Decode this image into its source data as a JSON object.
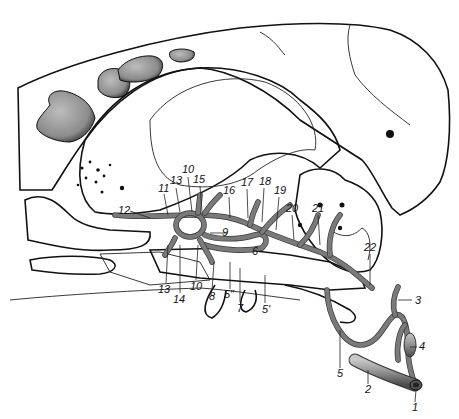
{
  "figure": {
    "type": "anatomical line drawing",
    "colors": {
      "background": "#ffffff",
      "line": "#111111",
      "stipple_bone": "#c9c9c9",
      "vessel": "#7a7a7a",
      "dark_foramen": "#111111"
    }
  },
  "labels": [
    {
      "id": "1",
      "text": "1",
      "x": 412,
      "y": 411
    },
    {
      "id": "2",
      "text": "2",
      "x": 365,
      "y": 393
    },
    {
      "id": "3",
      "text": "3",
      "x": 415,
      "y": 304
    },
    {
      "id": "4",
      "text": "4",
      "x": 419,
      "y": 350
    },
    {
      "id": "5",
      "text": "5",
      "x": 337,
      "y": 377
    },
    {
      "id": "5prime",
      "text": "5'",
      "x": 262,
      "y": 313
    },
    {
      "id": "5doubleprime",
      "text": "5\"",
      "x": 226,
      "y": 298
    },
    {
      "id": "6",
      "text": "6",
      "x": 252,
      "y": 255
    },
    {
      "id": "7",
      "text": "7",
      "x": 238,
      "y": 311
    },
    {
      "id": "8",
      "text": "8",
      "x": 209,
      "y": 300
    },
    {
      "id": "9",
      "text": "9",
      "x": 219,
      "y": 233
    },
    {
      "id": "10a",
      "text": "10",
      "x": 184,
      "y": 173
    },
    {
      "id": "10b",
      "text": "10",
      "x": 192,
      "y": 290
    },
    {
      "id": "11",
      "text": "11",
      "x": 161,
      "y": 190
    },
    {
      "id": "12",
      "text": "12",
      "x": 120,
      "y": 213
    },
    {
      "id": "13a",
      "text": "13",
      "x": 172,
      "y": 184
    },
    {
      "id": "13b",
      "text": "13",
      "x": 160,
      "y": 293
    },
    {
      "id": "14",
      "text": "14",
      "x": 173,
      "y": 302
    },
    {
      "id": "15",
      "text": "15",
      "x": 196,
      "y": 182
    },
    {
      "id": "16",
      "text": "16",
      "x": 225,
      "y": 193
    },
    {
      "id": "17",
      "text": "17",
      "x": 243,
      "y": 185
    },
    {
      "id": "18",
      "text": "18",
      "x": 261,
      "y": 184
    },
    {
      "id": "19",
      "text": "19",
      "x": 276,
      "y": 193
    },
    {
      "id": "20",
      "text": "20",
      "x": 288,
      "y": 211
    },
    {
      "id": "21",
      "text": "21",
      "x": 314,
      "y": 211
    },
    {
      "id": "22",
      "text": "22",
      "x": 366,
      "y": 250
    }
  ]
}
